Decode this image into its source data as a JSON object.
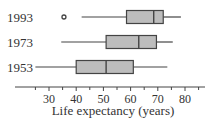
{
  "chart_data": {
    "type": "boxplot",
    "title": "",
    "xlabel": "Life expectancy (years)",
    "ylabel": "",
    "xlim": [
      22,
      88
    ],
    "xticks": [
      30,
      40,
      50,
      60,
      70,
      80
    ],
    "minor_tick_step": 5,
    "grid": false,
    "categories": [
      "1993",
      "1973",
      "1953"
    ],
    "series": [
      {
        "name": "1993",
        "whisker_low": 42,
        "q1": 58.5,
        "median": 68.5,
        "q3": 72,
        "whisker_high": 78.5,
        "outliers": [
          35.5
        ]
      },
      {
        "name": "1973",
        "whisker_low": 34.5,
        "q1": 51,
        "median": 63,
        "q3": 69.5,
        "whisker_high": 75.5,
        "outliers": []
      },
      {
        "name": "1953",
        "whisker_low": 25,
        "q1": 40,
        "median": 51,
        "q3": 61,
        "whisker_high": 73.5,
        "outliers": []
      }
    ],
    "colors": {
      "box_fill": "#bdbdbd",
      "box_stroke": "#444444",
      "axis": "#444444"
    }
  }
}
